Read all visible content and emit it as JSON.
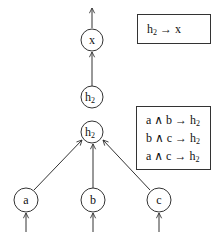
{
  "diagram": {
    "nodes": [
      {
        "id": "x",
        "label": "x",
        "sub": "",
        "cx": 92,
        "cy": 40
      },
      {
        "id": "h2_top",
        "label": "h",
        "sub": "2",
        "cx": 92,
        "cy": 97
      },
      {
        "id": "h2_mid",
        "label": "h",
        "sub": "2",
        "cx": 92,
        "cy": 132
      },
      {
        "id": "a",
        "label": "a",
        "sub": "",
        "cx": 26,
        "cy": 200
      },
      {
        "id": "b",
        "label": "b",
        "sub": "",
        "cx": 93,
        "cy": 200
      },
      {
        "id": "c",
        "label": "c",
        "sub": "",
        "cx": 159,
        "cy": 200
      }
    ],
    "edges": [
      {
        "from": "h2_top",
        "to": "x"
      },
      {
        "from": "a",
        "to": "h2_mid"
      },
      {
        "from": "b",
        "to": "h2_mid"
      },
      {
        "from": "c",
        "to": "h2_mid"
      }
    ],
    "rule_boxes": {
      "top": {
        "rules": [
          {
            "lhs": "h",
            "lhs_sub": "2",
            "arrow": "→",
            "rhs": "x",
            "rhs_sub": ""
          }
        ]
      },
      "bottom": {
        "rules": [
          {
            "lhs": "a ∧ b ",
            "lhs_sub": "",
            "arrow": "→",
            "rhs": "h",
            "rhs_sub": "2"
          },
          {
            "lhs": "b ∧ c ",
            "lhs_sub": "",
            "arrow": "→",
            "rhs": "h",
            "rhs_sub": "2"
          },
          {
            "lhs": "a ∧ c ",
            "lhs_sub": "",
            "arrow": "→",
            "rhs": "h",
            "rhs_sub": "2"
          }
        ]
      }
    },
    "colors": {
      "stroke": "#333333",
      "text": "#111111",
      "background": "#ffffff"
    }
  }
}
